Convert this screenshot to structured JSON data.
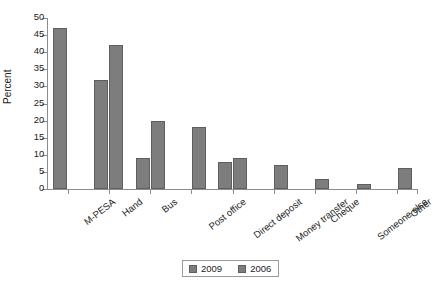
{
  "chart_data": {
    "type": "bar",
    "title": "",
    "subtitle": "",
    "xlabel": "",
    "ylabel": "Percent",
    "ylim": [
      0,
      50
    ],
    "yticks": [
      0,
      5,
      10,
      15,
      20,
      25,
      30,
      35,
      40,
      45,
      50
    ],
    "grid": false,
    "legend_position": "bottom-center",
    "categories": [
      "M-PESA",
      "Hand",
      "Bus",
      "Post office",
      "Direct deposit",
      "Money transfer",
      "Cheque",
      "Someone else",
      "Other"
    ],
    "series": [
      {
        "name": "2009",
        "color": "#7d7d7d",
        "values": [
          47,
          32,
          9,
          0,
          8,
          0,
          0,
          0,
          0
        ]
      },
      {
        "name": "2006",
        "color": "#7d7d7d",
        "values": [
          0,
          42,
          20,
          18,
          9,
          7,
          3,
          1.5,
          6
        ]
      }
    ]
  },
  "axis": {
    "y_title": "Percent"
  },
  "legend": {
    "items": [
      {
        "label": "2009"
      },
      {
        "label": "2006"
      }
    ]
  }
}
